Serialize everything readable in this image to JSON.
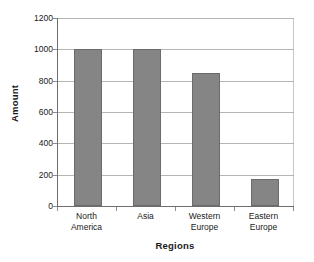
{
  "chart_data": {
    "type": "bar",
    "title": "",
    "xlabel": "Regions",
    "ylabel": "Amount",
    "categories": [
      "North America",
      "Asia",
      "Western Europe",
      "Eastern Europe"
    ],
    "category_lines": [
      [
        "North",
        "America"
      ],
      [
        "Asia",
        ""
      ],
      [
        "Western",
        "Europe"
      ],
      [
        "Eastern",
        "Europe"
      ]
    ],
    "values": [
      1000,
      1000,
      850,
      175
    ],
    "ylim": [
      0,
      1200
    ],
    "ytick_values": [
      0,
      200,
      400,
      600,
      800,
      1000,
      1200
    ],
    "ytick_labels": [
      "0",
      "200",
      "400",
      "600",
      "800",
      "1000",
      "1200"
    ],
    "grid": "horizontal",
    "legend": "none",
    "bar_color": "#858585",
    "bar_border_color": "#6b6b6b",
    "gridline_color": "#b5b5b5",
    "axis_color": "#6e6e6e"
  }
}
